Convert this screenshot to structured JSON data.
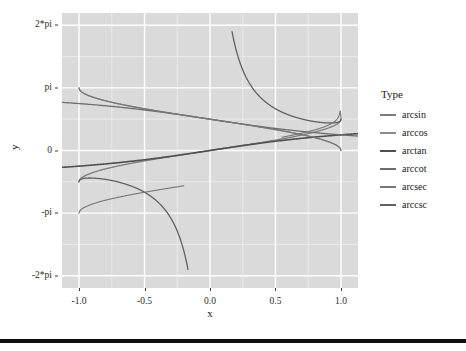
{
  "figure": {
    "background": "#ffffff",
    "panel_background": "#dadada",
    "gridline_major_color": "#ffffff",
    "gridline_minor_color": "#ededed"
  },
  "legend": {
    "title": "Type",
    "position": "right",
    "items": [
      {
        "label": "arcsin",
        "color": "#7d7d7d"
      },
      {
        "label": "arccos",
        "color": "#8a8a8a"
      },
      {
        "label": "arctan",
        "color": "#4f4f4f"
      },
      {
        "label": "arccot",
        "color": "#6e6e6e"
      },
      {
        "label": "arcsec",
        "color": "#767676"
      },
      {
        "label": "arccsc",
        "color": "#606060"
      }
    ]
  },
  "axes": {
    "x": {
      "label": "x",
      "ticks": [
        "-1.0",
        "-0.5",
        "0.0",
        "0.5",
        "1.0"
      ],
      "tick_values": [
        -1.0,
        -0.5,
        0.0,
        0.5,
        1.0
      ],
      "limits": [
        -1.13,
        1.13
      ]
    },
    "y": {
      "label": "y",
      "ticks": [
        "2*pi",
        "pi",
        "0",
        "-pi",
        "-2*pi"
      ],
      "tick_values": [
        6.283185,
        3.141593,
        0,
        -3.141593,
        -6.283185
      ],
      "limits": [
        -6.9,
        6.9
      ]
    }
  },
  "chart_data": {
    "type": "line",
    "title": "",
    "xlabel": "x",
    "ylabel": "y",
    "xlim": [
      -1.13,
      1.13
    ],
    "ylim": [
      -6.9,
      6.9
    ],
    "grid": true,
    "legend_title": "Type",
    "legend_position": "right",
    "x_ticks": [
      -1.0,
      -0.5,
      0.0,
      0.5,
      1.0
    ],
    "x_tick_labels": [
      "-1.0",
      "-0.5",
      "0.0",
      "0.5",
      "1.0"
    ],
    "y_ticks": [
      6.283185,
      3.141593,
      0,
      -3.141593,
      -6.283185
    ],
    "y_tick_labels": [
      "2*pi",
      "pi",
      "0",
      "-pi",
      "-2*pi"
    ],
    "series": [
      {
        "name": "arcsin",
        "color": "#7d7d7d",
        "x": [
          -1.0,
          -0.9,
          -0.8,
          -0.7,
          -0.6,
          -0.5,
          -0.4,
          -0.3,
          -0.2,
          -0.1,
          0.0,
          0.1,
          0.2,
          0.3,
          0.4,
          0.5,
          0.6,
          0.7,
          0.8,
          0.9,
          1.0
        ],
        "values": [
          -1.5708,
          -1.1198,
          -0.9273,
          -0.7754,
          -0.6435,
          -0.5236,
          -0.4115,
          -0.3047,
          -0.2014,
          -0.1002,
          0.0,
          0.1002,
          0.2014,
          0.3047,
          0.4115,
          0.5236,
          0.6435,
          0.7754,
          0.9273,
          1.1198,
          1.5708
        ]
      },
      {
        "name": "arccos",
        "color": "#8a8a8a",
        "x": [
          -1.0,
          -0.9,
          -0.8,
          -0.7,
          -0.6,
          -0.5,
          -0.4,
          -0.3,
          -0.2,
          -0.1,
          0.0,
          0.1,
          0.2,
          0.3,
          0.4,
          0.5,
          0.6,
          0.7,
          0.8,
          0.9,
          1.0
        ],
        "values": [
          3.1416,
          2.6906,
          2.4981,
          2.3462,
          2.2143,
          2.0944,
          1.9823,
          1.8755,
          1.7722,
          1.671,
          1.5708,
          1.4706,
          1.3694,
          1.2661,
          1.1593,
          1.0472,
          0.9273,
          0.7954,
          0.6435,
          0.451,
          0.0
        ]
      },
      {
        "name": "arctan",
        "color": "#4f4f4f",
        "x": [
          -1.0,
          -0.8,
          -0.6,
          -0.4,
          -0.2,
          0.0,
          0.2,
          0.4,
          0.6,
          0.8,
          1.0
        ],
        "values": [
          -0.7854,
          -0.6747,
          -0.5404,
          -0.3805,
          -0.1974,
          0.0,
          0.1974,
          0.3805,
          0.5404,
          0.6747,
          0.7854
        ]
      },
      {
        "name": "arccot",
        "color": "#6e6e6e",
        "x": [
          -1.0,
          -0.8,
          -0.6,
          -0.4,
          -0.2,
          0.0,
          0.2,
          0.4,
          0.6,
          0.8,
          1.0
        ],
        "values": [
          2.3562,
          2.2455,
          2.1112,
          1.9513,
          1.7682,
          1.5708,
          1.3734,
          1.1903,
          1.0304,
          0.8961,
          0.7854
        ]
      },
      {
        "name": "arcsec",
        "color": "#767676",
        "x": [
          -1.0,
          -0.98,
          -0.95,
          -0.9,
          0.9,
          0.95,
          0.98,
          1.0
        ],
        "values": [
          3.1416,
          2.9413,
          2.8198,
          2.6906,
          0.451,
          0.3176,
          0.2003,
          0.0
        ],
        "note": "defined only for |x| >= 1 in principal form; plotted branches near edges"
      },
      {
        "name": "arccsc",
        "color": "#606060",
        "x": [
          -1.0,
          -0.95,
          -0.9,
          -0.8,
          -0.6,
          -0.4,
          -0.3,
          -0.2,
          -0.17,
          0.17,
          0.2,
          0.3,
          0.4,
          0.6,
          0.8,
          0.9,
          0.95,
          1.0
        ],
        "values": [
          -1.5708,
          -1.8,
          -2.0,
          -2.4,
          -3.3,
          -4.4,
          -5.2,
          -6.0,
          -6.28,
          6.28,
          6.0,
          5.2,
          4.4,
          3.3,
          2.4,
          2.0,
          1.8,
          1.5708
        ],
        "note": "steep asymptotic branches approaching +/- 2*pi"
      }
    ]
  }
}
